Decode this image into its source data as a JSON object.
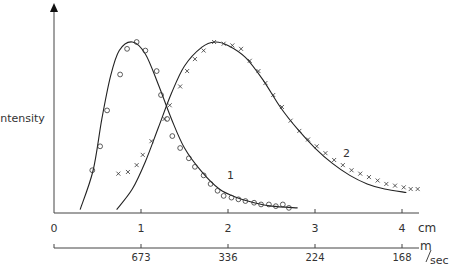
{
  "chart_data": {
    "type": "line",
    "title": "",
    "ylabel": "Intensity",
    "xlabel": "cm",
    "secondary_xlabel": "m/sec",
    "x_ticks": [
      0,
      1,
      2,
      3,
      4
    ],
    "x_tick_labels": [
      "0",
      "1",
      "2",
      "3",
      "4"
    ],
    "secondary_x_ticks": [
      1,
      2,
      3,
      4
    ],
    "secondary_x_tick_labels": [
      "673",
      "336",
      "224",
      "168"
    ],
    "xlim": [
      0,
      4.2
    ],
    "ylim": [
      0,
      1.0
    ],
    "grid": false,
    "series": [
      {
        "name": "1",
        "marker": "circle",
        "curve": [
          [
            0.3,
            0.02
          ],
          [
            0.45,
            0.25
          ],
          [
            0.55,
            0.55
          ],
          [
            0.65,
            0.8
          ],
          [
            0.75,
            0.95
          ],
          [
            0.9,
            1.0
          ],
          [
            1.05,
            0.93
          ],
          [
            1.2,
            0.75
          ],
          [
            1.35,
            0.55
          ],
          [
            1.5,
            0.38
          ],
          [
            1.7,
            0.24
          ],
          [
            1.9,
            0.14
          ],
          [
            2.1,
            0.09
          ],
          [
            2.3,
            0.06
          ],
          [
            2.5,
            0.04
          ],
          [
            2.8,
            0.03
          ]
        ],
        "points": [
          [
            0.44,
            0.25
          ],
          [
            0.53,
            0.39
          ],
          [
            0.61,
            0.6
          ],
          [
            0.76,
            0.81
          ],
          [
            0.84,
            0.96
          ],
          [
            0.95,
            1.0
          ],
          [
            1.05,
            0.95
          ],
          [
            1.18,
            0.83
          ],
          [
            1.23,
            0.69
          ],
          [
            1.3,
            0.55
          ],
          [
            1.36,
            0.45
          ],
          [
            1.45,
            0.38
          ],
          [
            1.55,
            0.32
          ],
          [
            1.62,
            0.27
          ],
          [
            1.72,
            0.22
          ],
          [
            1.8,
            0.17
          ],
          [
            1.88,
            0.13
          ],
          [
            1.95,
            0.1
          ],
          [
            2.04,
            0.09
          ],
          [
            2.12,
            0.08
          ],
          [
            2.2,
            0.07
          ],
          [
            2.3,
            0.06
          ],
          [
            2.38,
            0.05
          ],
          [
            2.47,
            0.05
          ],
          [
            2.55,
            0.04
          ],
          [
            2.63,
            0.05
          ],
          [
            2.7,
            0.03
          ]
        ]
      },
      {
        "name": "2",
        "marker": "cross",
        "curve": [
          [
            0.72,
            0.02
          ],
          [
            0.9,
            0.14
          ],
          [
            1.05,
            0.3
          ],
          [
            1.2,
            0.5
          ],
          [
            1.35,
            0.7
          ],
          [
            1.5,
            0.86
          ],
          [
            1.7,
            0.97
          ],
          [
            1.85,
            1.0
          ],
          [
            2.0,
            0.98
          ],
          [
            2.2,
            0.91
          ],
          [
            2.4,
            0.78
          ],
          [
            2.6,
            0.62
          ],
          [
            2.8,
            0.49
          ],
          [
            3.0,
            0.38
          ],
          [
            3.2,
            0.29
          ],
          [
            3.4,
            0.22
          ],
          [
            3.6,
            0.17
          ],
          [
            3.8,
            0.14
          ],
          [
            4.05,
            0.12
          ]
        ],
        "points": [
          [
            0.74,
            0.23
          ],
          [
            0.85,
            0.24
          ],
          [
            0.95,
            0.28
          ],
          [
            1.02,
            0.34
          ],
          [
            1.12,
            0.42
          ],
          [
            1.27,
            0.55
          ],
          [
            1.33,
            0.63
          ],
          [
            1.45,
            0.74
          ],
          [
            1.53,
            0.83
          ],
          [
            1.62,
            0.9
          ],
          [
            1.72,
            0.95
          ],
          [
            1.84,
            1.0
          ],
          [
            1.95,
            0.99
          ],
          [
            2.05,
            0.98
          ],
          [
            2.15,
            0.96
          ],
          [
            2.25,
            0.89
          ],
          [
            2.35,
            0.83
          ],
          [
            2.43,
            0.76
          ],
          [
            2.52,
            0.69
          ],
          [
            2.62,
            0.62
          ],
          [
            2.72,
            0.54
          ],
          [
            2.82,
            0.48
          ],
          [
            2.92,
            0.43
          ],
          [
            3.02,
            0.39
          ],
          [
            3.12,
            0.35
          ],
          [
            3.22,
            0.31
          ],
          [
            3.32,
            0.28
          ],
          [
            3.42,
            0.25
          ],
          [
            3.52,
            0.23
          ],
          [
            3.62,
            0.21
          ],
          [
            3.72,
            0.19
          ],
          [
            3.82,
            0.17
          ],
          [
            3.92,
            0.16
          ],
          [
            4.02,
            0.15
          ],
          [
            4.1,
            0.14
          ],
          [
            4.18,
            0.14
          ]
        ]
      }
    ],
    "annotations": [
      {
        "text": "1",
        "x": 2.05,
        "y": 0.22
      },
      {
        "text": "2",
        "x": 3.35,
        "y": 0.4
      }
    ]
  },
  "labels": {
    "y_axis": "Intensity",
    "x_unit": "cm",
    "secondary_unit_m": "m",
    "secondary_unit_sec": "sec",
    "curve1": "1",
    "curve2": "2"
  },
  "colors": {
    "ink": "#333333",
    "background": "#ffffff"
  }
}
